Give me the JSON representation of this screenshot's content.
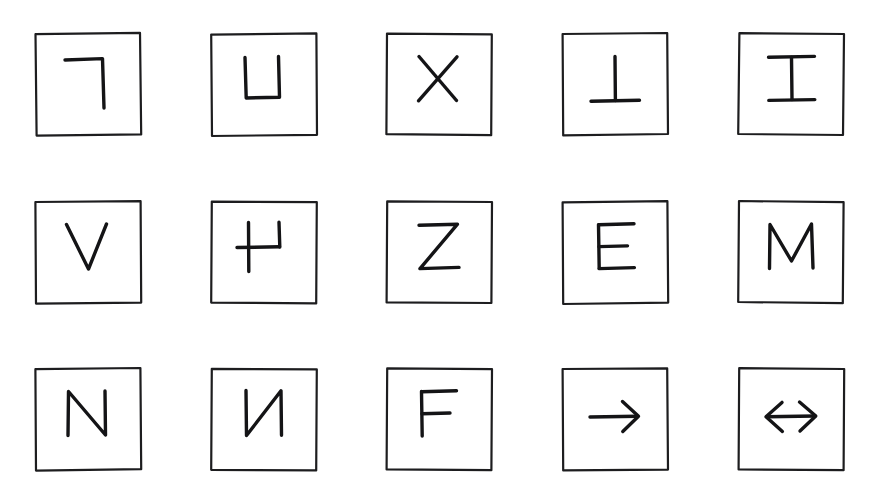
{
  "page": {
    "background_color": "#ffffff",
    "ink_color": "#141416",
    "frame_color": "#1d1d1f",
    "columns": 5,
    "rows": 3,
    "card_count": 15
  },
  "cards": [
    {
      "index": 1,
      "row": 1,
      "column": 1,
      "glyph": "┐",
      "glyph_name": "rotated-l-corner",
      "description": "Letter L rotated 180 degrees: horizontal bar at top with vertical stroke descending from its right end"
    },
    {
      "index": 2,
      "row": 1,
      "column": 2,
      "glyph": "U",
      "glyph_name": "letter-u",
      "description": "Capital letter U"
    },
    {
      "index": 3,
      "row": 1,
      "column": 3,
      "glyph": "X",
      "glyph_name": "letter-x",
      "description": "Capital letter X"
    },
    {
      "index": 4,
      "row": 1,
      "column": 4,
      "glyph": "⊥",
      "glyph_name": "up-tack-inverted-t",
      "description": "Letter T rotated 180 degrees: vertical stem with horizontal bar at the bottom"
    },
    {
      "index": 5,
      "row": 1,
      "column": 5,
      "glyph": "⌶",
      "glyph_name": "letter-i-serif",
      "description": "Capital letter I with top and bottom serif bars"
    },
    {
      "index": 6,
      "row": 2,
      "column": 1,
      "glyph": "V",
      "glyph_name": "letter-v",
      "description": "Capital letter V"
    },
    {
      "index": 7,
      "row": 2,
      "column": 2,
      "glyph": "⊣",
      "glyph_name": "rotated-u-with-stem",
      "description": "Letter U rotated 90 degrees clockwise: horizontal bar with two short verticals, left stem extended below"
    },
    {
      "index": 8,
      "row": 2,
      "column": 3,
      "glyph": "Z",
      "glyph_name": "letter-z",
      "description": "Capital letter Z"
    },
    {
      "index": 9,
      "row": 2,
      "column": 4,
      "glyph": "E",
      "glyph_name": "letter-e",
      "description": "Capital letter E"
    },
    {
      "index": 10,
      "row": 2,
      "column": 5,
      "glyph": "M",
      "glyph_name": "letter-m",
      "description": "Capital letter M"
    },
    {
      "index": 11,
      "row": 3,
      "column": 1,
      "glyph": "N",
      "glyph_name": "letter-n",
      "description": "Capital letter N"
    },
    {
      "index": 12,
      "row": 3,
      "column": 2,
      "glyph": "И",
      "glyph_name": "mirrored-letter-n",
      "description": "Capital letter N mirrored horizontally"
    },
    {
      "index": 13,
      "row": 3,
      "column": 3,
      "glyph": "F",
      "glyph_name": "letter-f",
      "description": "Capital letter F"
    },
    {
      "index": 14,
      "row": 3,
      "column": 4,
      "glyph": "→",
      "glyph_name": "rightwards-arrow",
      "description": "Arrow pointing right"
    },
    {
      "index": 15,
      "row": 3,
      "column": 5,
      "glyph": "↔",
      "glyph_name": "left-right-arrow",
      "description": "Double-headed arrow pointing left and right"
    }
  ]
}
